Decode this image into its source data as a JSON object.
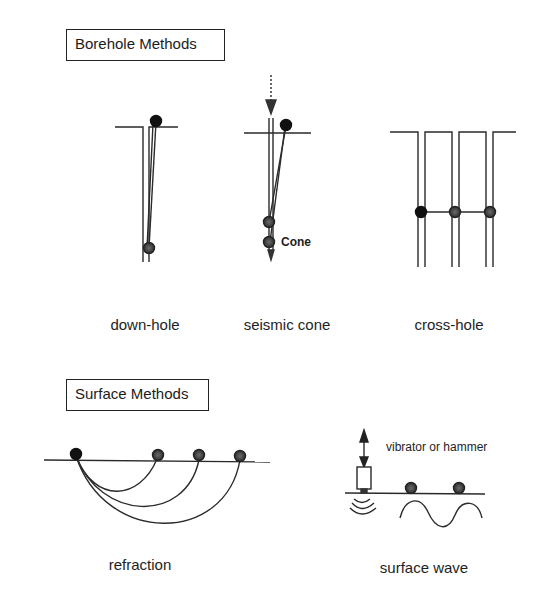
{
  "figure": {
    "sections": {
      "borehole": {
        "title": "Borehole Methods"
      },
      "surface": {
        "title": "Surface Methods"
      }
    },
    "panels": {
      "down_hole": {
        "caption": "down-hole"
      },
      "seismic_cone": {
        "caption": "seismic cone",
        "probe_label": "Cone"
      },
      "cross_hole": {
        "caption": "cross-hole"
      },
      "refraction": {
        "caption": "refraction"
      },
      "surface_wave": {
        "caption": "surface wave",
        "source_label": "vibrator or hammer"
      }
    },
    "colors": {
      "line": "#2a2a2a",
      "receiver_fill": "#3a3a3a",
      "source_fill": "#111111",
      "background": "#ffffff"
    },
    "icons": {
      "source": "filled-circle",
      "receiver": "shaded-circle",
      "impact_arrow": "down-arrow",
      "vibration": "double-headed-vertical-arrow",
      "wave": "sine-wave",
      "emitted_waves": "concentric-arcs"
    }
  }
}
